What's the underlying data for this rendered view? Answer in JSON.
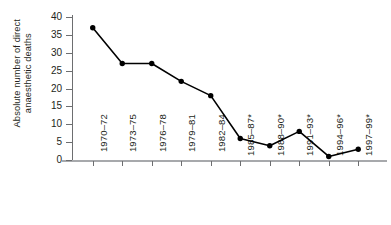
{
  "chart_data": {
    "type": "line",
    "title": "",
    "xlabel": "",
    "ylabel_lines": [
      "Absolute number of direct",
      "anaesthetic deaths"
    ],
    "ylabel": "Absolute number of direct anaesthetic deaths",
    "categories": [
      "1970–72",
      "1973–75",
      "1976–78",
      "1979–81",
      "1982–84",
      "1985–87*",
      "1988–90*",
      "1991–93*",
      "1994–96*",
      "1997–99*"
    ],
    "values": [
      37,
      27,
      27,
      22,
      18,
      6,
      4,
      8,
      1,
      3
    ],
    "yticks": [
      0,
      5,
      10,
      15,
      20,
      25,
      30,
      35,
      40
    ],
    "ytick_labels": [
      "0",
      "5",
      "10",
      "15",
      "20",
      "25",
      "30",
      "35",
      "40"
    ],
    "ylim": [
      0,
      40
    ],
    "grid": false,
    "legend": "none",
    "marker": "filled-circle",
    "line_color": "#000000",
    "marker_color": "#000000",
    "axis_color": "#6d6e70",
    "baseline_color": "#a7a9ac",
    "text_color": "#231f20",
    "background": "#ffffff"
  }
}
